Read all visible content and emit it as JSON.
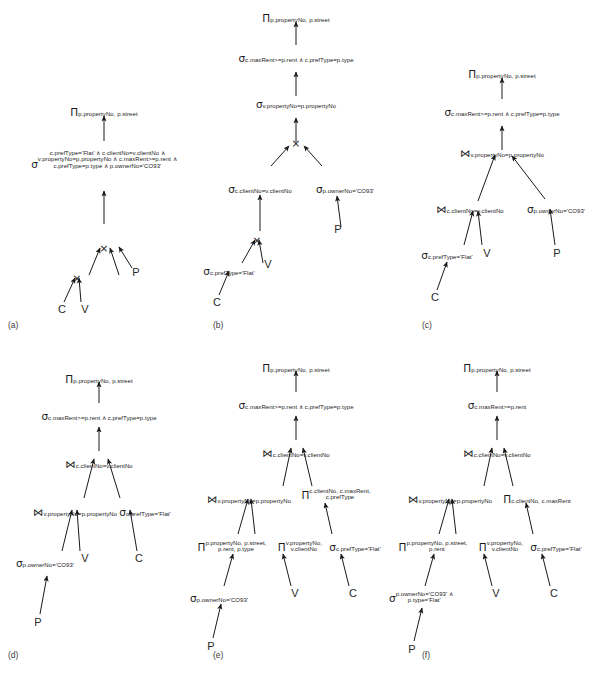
{
  "figure": {
    "background": "#ffffff",
    "ink": "#1a1a1a"
  },
  "symbols": {
    "project": "Π",
    "select": "σ",
    "cartesian_product": "×",
    "join": "⋈",
    "and": "∧"
  },
  "relations": {
    "client": "C",
    "viewing": "V",
    "property": "P"
  },
  "panels": [
    {
      "id": "a",
      "label": "(a)",
      "nodes": {
        "project_root": {
          "op": "Π",
          "sub": "p.propertyNo, p.street"
        },
        "select_all": {
          "op": "σ",
          "lines": [
            "c.prefType='Flat' ∧ c.clientNo=v.clientNo ∧",
            "v.propertyNo=p.propertyNo ∧ c.maxRent>=p.rent ∧",
            "c.prefType=p.type ∧ p.ownerNo='CO93'"
          ]
        },
        "product_upper": {
          "op": "×",
          "sub": ""
        },
        "product_lower": {
          "op": "×",
          "sub": ""
        },
        "leaf_c": "C",
        "leaf_v": "V",
        "leaf_p": "P"
      }
    },
    {
      "id": "b",
      "label": "(b)",
      "nodes": {
        "project_root": {
          "op": "Π",
          "sub": "p.propertyNo, p.street"
        },
        "select_rent_type": {
          "op": "σ",
          "sub": "c.maxRent>=p.rent ∧ c.prefType=p.type"
        },
        "select_propno": {
          "op": "σ",
          "sub": "v.propertyNo=p.propertyNo"
        },
        "product": {
          "op": "×",
          "sub": ""
        },
        "select_clientno": {
          "op": "σ",
          "sub": "c.clientNo=v.clientNo"
        },
        "select_owner": {
          "op": "σ",
          "sub": "p.ownerNo='CO93'"
        },
        "product_lower": {
          "op": "×",
          "sub": ""
        },
        "select_preftype": {
          "op": "σ",
          "sub": "c.prefType='Flat'"
        },
        "leaf_c": "C",
        "leaf_v": "V",
        "leaf_p": "P"
      }
    },
    {
      "id": "c",
      "label": "(c)",
      "nodes": {
        "project_root": {
          "op": "Π",
          "sub": "p.propertyNo, p.street"
        },
        "select_rent_type": {
          "op": "σ",
          "sub": "c.maxRent>=p.rent ∧ c.prefType=p.type"
        },
        "join_propno": {
          "op": "⋈",
          "sub": "v.propertyNo=p.propertyNo"
        },
        "join_clientno": {
          "op": "⋈",
          "sub": "c.clientNo=v.clientNo"
        },
        "select_owner": {
          "op": "σ",
          "sub": "p.ownerNo='CO93'"
        },
        "select_preftype": {
          "op": "σ",
          "sub": "c.prefType='Flat'"
        },
        "leaf_c": "C",
        "leaf_v": "V",
        "leaf_p": "P"
      }
    },
    {
      "id": "d",
      "label": "(d)",
      "nodes": {
        "project_root": {
          "op": "Π",
          "sub": "p.propertyNo, p.street"
        },
        "select_rent_type": {
          "op": "σ",
          "sub": "c.maxRent>=p.rent ∧ c.prefType=p.type"
        },
        "join_clientno": {
          "op": "⋈",
          "sub": "c.clientNo=v.clientNo"
        },
        "join_propno": {
          "op": "⋈",
          "sub": "v.propertyNo=p.propertyNo"
        },
        "select_preftype": {
          "op": "σ",
          "sub": "c.prefType='Flat'"
        },
        "select_owner": {
          "op": "σ",
          "sub": "p.ownerNo='CO93'"
        },
        "leaf_p": "P",
        "leaf_v": "V",
        "leaf_c": "C"
      }
    },
    {
      "id": "e",
      "label": "(e)",
      "nodes": {
        "project_root": {
          "op": "Π",
          "sub": "p.propertyNo, p.street"
        },
        "select_rent_type": {
          "op": "σ",
          "sub": "c.maxRent>=p.rent ∧ c.prefType=p.type"
        },
        "join_clientno": {
          "op": "⋈",
          "sub": "c.clientNo=v.clientNo"
        },
        "join_propno": {
          "op": "⋈",
          "sub": "v.propertyNo=p.propertyNo"
        },
        "project_client": {
          "op": "Π",
          "lines": [
            "c.clientNo, c.maxRent,",
            "c.prefType"
          ]
        },
        "project_property": {
          "op": "Π",
          "lines": [
            "p.propertyNo, p.street,",
            "p.rent, p.type"
          ]
        },
        "project_viewing": {
          "op": "Π",
          "lines": [
            "v.propertyNo,",
            "v.clientNo"
          ]
        },
        "select_preftype": {
          "op": "σ",
          "sub": "c.prefType='Flat'"
        },
        "select_owner": {
          "op": "σ",
          "sub": "p.ownerNo='CO93'"
        },
        "leaf_p": "P",
        "leaf_v": "V",
        "leaf_c": "C"
      }
    },
    {
      "id": "f",
      "label": "(f)",
      "nodes": {
        "project_root": {
          "op": "Π",
          "sub": "p.propertyNo, p.street"
        },
        "select_rent": {
          "op": "σ",
          "sub": "c.maxRent>=p.rent"
        },
        "join_clientno": {
          "op": "⋈",
          "sub": "c.clientNo=v.clientNo"
        },
        "join_propno": {
          "op": "⋈",
          "sub": "v.propertyNo=p.propertyNo"
        },
        "project_client": {
          "op": "Π",
          "sub": "c.clientNo, c.maxRent"
        },
        "project_property": {
          "op": "Π",
          "lines": [
            "p.propertyNo, p.street,",
            "p.rent"
          ]
        },
        "project_viewing": {
          "op": "Π",
          "lines": [
            "v.propertyNo,",
            "v.clientNo"
          ]
        },
        "select_preftype": {
          "op": "σ",
          "sub": "c.prefType='Flat'"
        },
        "select_owner_type": {
          "op": "σ",
          "lines": [
            "p.ownerNo='CO93' ∧",
            "p.type='Flat'"
          ]
        },
        "leaf_p": "P",
        "leaf_v": "V",
        "leaf_c": "C"
      }
    }
  ]
}
